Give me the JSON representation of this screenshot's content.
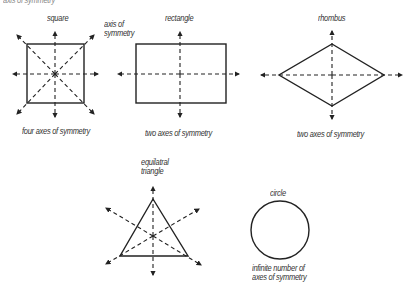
{
  "title": "axis of symmetry",
  "shapes": [
    {
      "name": "square",
      "caption": "four axes of symmetry",
      "axes": 4
    },
    {
      "name": "rectangle",
      "caption": "two axes of symmetry",
      "axes": 2
    },
    {
      "name": "rhombus",
      "caption": "two axes of symmetry",
      "axes": 2
    },
    {
      "name": "equilatral",
      "name2": "triangle",
      "caption": "",
      "axes": 3
    },
    {
      "name": "circle",
      "caption": "infinite number of",
      "caption2": "axes of symmetry",
      "axes": "infinite"
    }
  ],
  "annotation": {
    "line1": "axis of",
    "line2": "symmetry"
  },
  "colors": {
    "stroke": "#222222",
    "text": "#333333"
  }
}
